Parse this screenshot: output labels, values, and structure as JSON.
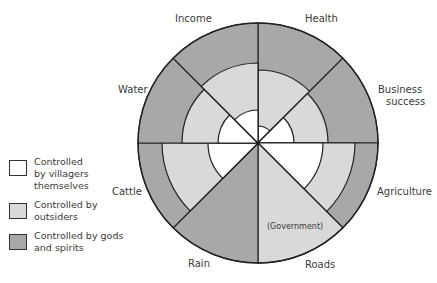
{
  "diagram": {
    "center": [
      258,
      143
    ],
    "outer_radius": 120,
    "colors": {
      "villagers": "#ffffff",
      "outsiders": "#d9d9d9",
      "gods": "#a8a8a8",
      "stroke": "#222222"
    },
    "sectors": [
      {
        "label": "Health",
        "start": 0,
        "end": 45,
        "villagers_r": 17,
        "outsiders_r": 73
      },
      {
        "label": "Business success",
        "start": 45,
        "end": 90,
        "villagers_r": 36,
        "outsiders_r": 70
      },
      {
        "label": "Agriculture",
        "start": 90,
        "end": 135,
        "villagers_r": 65,
        "outsiders_r": 97
      },
      {
        "label": "Roads",
        "start": 135,
        "end": 180,
        "villagers_r": 0,
        "outsiders_r": 120,
        "note": "(Government)"
      },
      {
        "label": "Rain",
        "start": 180,
        "end": 225,
        "villagers_r": 0,
        "outsiders_r": 0
      },
      {
        "label": "Cattle",
        "start": 225,
        "end": 270,
        "villagers_r": 50,
        "outsiders_r": 96
      },
      {
        "label": "Water",
        "start": 270,
        "end": 315,
        "villagers_r": 40,
        "outsiders_r": 76
      },
      {
        "label": "Income",
        "start": 315,
        "end": 360,
        "villagers_r": 33,
        "outsiders_r": 80
      }
    ]
  },
  "labels": {
    "health": "Health",
    "business_1": "Business",
    "business_2": "success",
    "agriculture": "Agriculture",
    "roads": "Roads",
    "roads_note": "(Government)",
    "rain": "Rain",
    "cattle": "Cattle",
    "water": "Water",
    "income": "Income"
  },
  "legend": [
    {
      "text": "Controlled by villagers themselves",
      "color": "#ffffff"
    },
    {
      "text": "Controlled by outsiders",
      "color": "#d9d9d9"
    },
    {
      "text": "Controlled by gods and spirits",
      "color": "#a8a8a8"
    }
  ]
}
